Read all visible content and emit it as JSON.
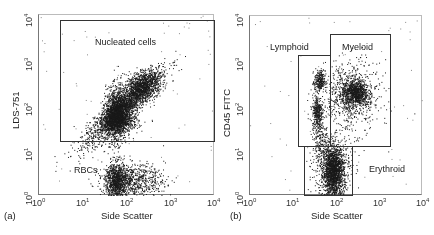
{
  "chart_data": [
    {
      "type": "scatter",
      "panel_label": "(a)",
      "xlabel": "Side Scatter",
      "ylabel": "LDS-751",
      "xscale": "log",
      "yscale": "log",
      "xlim": [
        1,
        10000
      ],
      "ylim": [
        1,
        10000
      ],
      "xticks": [
        "10^0",
        "10^1",
        "10^2",
        "10^3",
        "10^4"
      ],
      "yticks": [
        "10^0",
        "10^1",
        "10^2",
        "10^3",
        "10^4"
      ],
      "gates": [
        {
          "name": "Nucleated cells",
          "x_range": [
            3,
            10000
          ],
          "y_range": [
            15,
            8000
          ]
        }
      ],
      "populations": [
        {
          "name": "Nucleated cells",
          "center_log": [
            1.9,
            2.2
          ],
          "note": "diagonal cloud from ~(40,50) to ~(1000,3000)"
        },
        {
          "name": "RBCs",
          "center_log": [
            1.75,
            0.3
          ],
          "note": "horizontal cluster at SSC 30-800, LDS-751 1-3"
        }
      ]
    },
    {
      "type": "scatter",
      "panel_label": "(b)",
      "xlabel": "Side Scatter",
      "ylabel": "CD45 FITC",
      "xscale": "log",
      "yscale": "log",
      "xlim": [
        1,
        10000
      ],
      "ylim": [
        1,
        10000
      ],
      "xticks": [
        "10^0",
        "10^1",
        "10^2",
        "10^3",
        "10^4"
      ],
      "yticks": [
        "10^0",
        "10^1",
        "10^2",
        "10^3",
        "10^4"
      ],
      "gates": [
        {
          "name": "Lymphoid",
          "x_range": [
            13,
            70
          ],
          "y_range": [
            13,
            1400
          ]
        },
        {
          "name": "Myeloid",
          "x_range": [
            70,
            1800
          ],
          "y_range": [
            13,
            4500
          ]
        },
        {
          "name": "Erythroid",
          "x_range": [
            18,
            230
          ],
          "y_range": [
            1,
            13
          ]
        }
      ],
      "populations": [
        {
          "name": "Lymphoid",
          "center_log": [
            1.62,
            2.2
          ]
        },
        {
          "name": "Myeloid",
          "center_log": [
            2.4,
            2.25
          ]
        },
        {
          "name": "Erythroid",
          "center_log": [
            1.9,
            0.5
          ]
        }
      ]
    }
  ],
  "panels": {
    "a": {
      "label": "(a)",
      "xlabel": "Side Scatter",
      "ylabel": "LDS-751",
      "gate_label": "Nucleated cells",
      "cluster_label": "RBCs",
      "tick_base": "10",
      "tick_exps": [
        "0",
        "1",
        "2",
        "3",
        "4"
      ]
    },
    "b": {
      "label": "(b)",
      "xlabel": "Side Scatter",
      "ylabel": "CD45 FITC",
      "lymphoid_label": "Lymphoid",
      "myeloid_label": "Myeloid",
      "erythroid_label": "Erythroid",
      "tick_base": "10",
      "tick_exps": [
        "0",
        "1",
        "2",
        "3",
        "4"
      ]
    }
  },
  "colors": {
    "dots": "#1a1a1a",
    "gate": "#333333",
    "axis": "#777777"
  }
}
